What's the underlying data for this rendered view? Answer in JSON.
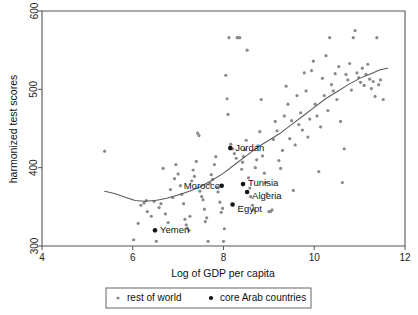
{
  "chart_data": {
    "type": "scatter",
    "title": "",
    "xlabel": "Log of GDP per capita",
    "ylabel": "harmonized test scores",
    "xlim": [
      4,
      12
    ],
    "ylim": [
      300,
      600
    ],
    "xticks": [
      4,
      6,
      8,
      10,
      12
    ],
    "yticks": [
      300,
      400,
      500,
      600
    ],
    "grid": false,
    "legend_position": "bottom",
    "colors": {
      "rest_of_world": "#8a8a8a",
      "core_arab": "#141414",
      "trend_line": "#5a5a5a",
      "axis": "#555555",
      "background": "#ffffff"
    },
    "legend": [
      {
        "label": "rest of world",
        "marker": "small-gray-dot",
        "color": "#8a8a8a"
      },
      {
        "label": "core Arab countries",
        "marker": "black-dot",
        "color": "#141414"
      }
    ],
    "series": [
      {
        "name": "rest of world",
        "marker_color": "#8a8a8a",
        "points": [
          [
            5.38,
            421
          ],
          [
            6.02,
            308
          ],
          [
            6.12,
            329
          ],
          [
            6.18,
            352
          ],
          [
            6.25,
            355
          ],
          [
            6.3,
            358
          ],
          [
            6.32,
            344
          ],
          [
            6.41,
            338
          ],
          [
            6.47,
            357
          ],
          [
            6.52,
            306
          ],
          [
            6.58,
            349
          ],
          [
            6.62,
            354
          ],
          [
            6.67,
            399
          ],
          [
            6.72,
            341
          ],
          [
            6.78,
            330
          ],
          [
            6.83,
            372
          ],
          [
            6.88,
            362
          ],
          [
            6.92,
            386
          ],
          [
            6.95,
            404
          ],
          [
            7.0,
            392
          ],
          [
            7.05,
            377
          ],
          [
            7.08,
            366
          ],
          [
            7.12,
            354
          ],
          [
            7.15,
            334
          ],
          [
            7.18,
            327
          ],
          [
            7.2,
            323
          ],
          [
            7.24,
            320
          ],
          [
            7.26,
            338
          ],
          [
            7.3,
            383
          ],
          [
            7.33,
            397
          ],
          [
            7.36,
            389
          ],
          [
            7.4,
            408
          ],
          [
            7.43,
            444
          ],
          [
            7.46,
            441
          ],
          [
            7.48,
            370
          ],
          [
            7.52,
            363
          ],
          [
            7.55,
            359
          ],
          [
            7.58,
            347
          ],
          [
            7.6,
            331
          ],
          [
            7.63,
            336
          ],
          [
            7.66,
            306
          ],
          [
            7.7,
            380
          ],
          [
            7.73,
            391
          ],
          [
            7.76,
            385
          ],
          [
            7.8,
            404
          ],
          [
            7.83,
            414
          ],
          [
            7.86,
            375
          ],
          [
            7.88,
            369
          ],
          [
            7.92,
            356
          ],
          [
            7.95,
            343
          ],
          [
            7.98,
            348
          ],
          [
            8.0,
            306
          ],
          [
            8.02,
            322
          ],
          [
            8.05,
            518
          ],
          [
            8.08,
            488
          ],
          [
            8.1,
            468
          ],
          [
            8.12,
            566
          ],
          [
            8.16,
            430
          ],
          [
            8.2,
            424
          ],
          [
            8.24,
            418
          ],
          [
            8.28,
            412
          ],
          [
            8.3,
            566
          ],
          [
            8.33,
            566
          ],
          [
            8.36,
            566
          ],
          [
            8.4,
            398
          ],
          [
            8.42,
            407
          ],
          [
            8.44,
            414
          ],
          [
            8.47,
            423
          ],
          [
            8.5,
            435
          ],
          [
            8.52,
            550
          ],
          [
            8.55,
            387
          ],
          [
            8.58,
            374
          ],
          [
            8.6,
            363
          ],
          [
            8.64,
            352
          ],
          [
            8.66,
            346
          ],
          [
            8.7,
            400
          ],
          [
            8.73,
            410
          ],
          [
            8.76,
            428
          ],
          [
            8.8,
            446
          ],
          [
            8.83,
            487
          ],
          [
            8.86,
            415
          ],
          [
            8.9,
            393
          ],
          [
            8.93,
            381
          ],
          [
            8.96,
            367
          ],
          [
            9.0,
            344
          ],
          [
            9.04,
            344
          ],
          [
            9.07,
            346
          ],
          [
            9.1,
            436
          ],
          [
            9.14,
            459
          ],
          [
            9.18,
            447
          ],
          [
            9.22,
            409
          ],
          [
            9.26,
            399
          ],
          [
            9.3,
            422
          ],
          [
            9.34,
            466
          ],
          [
            9.38,
            504
          ],
          [
            9.42,
            481
          ],
          [
            9.46,
            437
          ],
          [
            9.5,
            460
          ],
          [
            9.54,
            371
          ],
          [
            9.58,
            429
          ],
          [
            9.62,
            492
          ],
          [
            9.66,
            455
          ],
          [
            9.7,
            470
          ],
          [
            9.74,
            448
          ],
          [
            9.78,
            521
          ],
          [
            9.82,
            498
          ],
          [
            9.86,
            439
          ],
          [
            9.9,
            462
          ],
          [
            9.94,
            524
          ],
          [
            9.98,
            536
          ],
          [
            10.02,
            481
          ],
          [
            10.06,
            466
          ],
          [
            10.1,
            395
          ],
          [
            10.14,
            452
          ],
          [
            10.18,
            514
          ],
          [
            10.22,
            492
          ],
          [
            10.26,
            543
          ],
          [
            10.3,
            473
          ],
          [
            10.34,
            566
          ],
          [
            10.38,
            506
          ],
          [
            10.42,
            498
          ],
          [
            10.46,
            520
          ],
          [
            10.5,
            487
          ],
          [
            10.54,
            529
          ],
          [
            10.58,
            459
          ],
          [
            10.62,
            381
          ],
          [
            10.66,
            424
          ],
          [
            10.7,
            519
          ],
          [
            10.74,
            512
          ],
          [
            10.78,
            533
          ],
          [
            10.82,
            499
          ],
          [
            10.86,
            566
          ],
          [
            10.9,
            575
          ],
          [
            10.94,
            521
          ],
          [
            10.98,
            515
          ],
          [
            11.02,
            509
          ],
          [
            11.06,
            527
          ],
          [
            11.1,
            505
          ],
          [
            11.14,
            519
          ],
          [
            11.18,
            532
          ],
          [
            11.22,
            513
          ],
          [
            11.26,
            501
          ],
          [
            11.3,
            510
          ],
          [
            11.34,
            491
          ],
          [
            11.38,
            566
          ],
          [
            11.42,
            506
          ],
          [
            11.46,
            512
          ],
          [
            11.52,
            487
          ]
        ]
      },
      {
        "name": "core Arab countries",
        "marker_color": "#141414",
        "points": [
          {
            "country": "Jordan",
            "x": 8.15,
            "y": 425,
            "label_dx": 5,
            "label_dy": 3
          },
          {
            "country": "Morocco",
            "x": 7.96,
            "y": 377,
            "label_dx": -38,
            "label_dy": 3
          },
          {
            "country": "Tunisia",
            "x": 8.43,
            "y": 379,
            "label_dx": 5,
            "label_dy": 2
          },
          {
            "country": "Algeria",
            "x": 8.52,
            "y": 369,
            "label_dx": 5,
            "label_dy": 7
          },
          {
            "country": "Egypt",
            "x": 8.2,
            "y": 353,
            "label_dx": 5,
            "label_dy": 8
          },
          {
            "country": "Yemen",
            "x": 6.49,
            "y": 320,
            "label_dx": 5,
            "label_dy": 3
          }
        ]
      }
    ],
    "trend_line": {
      "name": "lowess fit",
      "points": [
        [
          5.38,
          370
        ],
        [
          5.6,
          367
        ],
        [
          5.85,
          362
        ],
        [
          6.05,
          358
        ],
        [
          6.25,
          357
        ],
        [
          6.5,
          358
        ],
        [
          6.75,
          361
        ],
        [
          7.0,
          365
        ],
        [
          7.25,
          370
        ],
        [
          7.5,
          376
        ],
        [
          7.75,
          384
        ],
        [
          8.0,
          393
        ],
        [
          8.25,
          404
        ],
        [
          8.5,
          415
        ],
        [
          8.75,
          426
        ],
        [
          9.0,
          435
        ],
        [
          9.25,
          444
        ],
        [
          9.5,
          455
        ],
        [
          9.75,
          466
        ],
        [
          10.0,
          477
        ],
        [
          10.25,
          488
        ],
        [
          10.5,
          497
        ],
        [
          10.75,
          506
        ],
        [
          11.0,
          514
        ],
        [
          11.25,
          520
        ],
        [
          11.45,
          525
        ],
        [
          11.62,
          527
        ]
      ]
    }
  },
  "axes": {
    "x_title": "Log of GDP per capita",
    "y_title": "harmonized test scores",
    "x_tick_labels": [
      "4",
      "6",
      "8",
      "10",
      "12"
    ],
    "y_tick_labels": [
      "300",
      "400",
      "500",
      "600"
    ]
  },
  "legend": {
    "entry_rest_label": "rest of world",
    "entry_arab_label": "core Arab countries"
  },
  "point_labels": {
    "jordan": "Jordan",
    "morocco": "Morocco",
    "tunisia": "Tunisia",
    "algeria": "Algeria",
    "egypt": "Egypt",
    "yemen": "Yemen"
  }
}
